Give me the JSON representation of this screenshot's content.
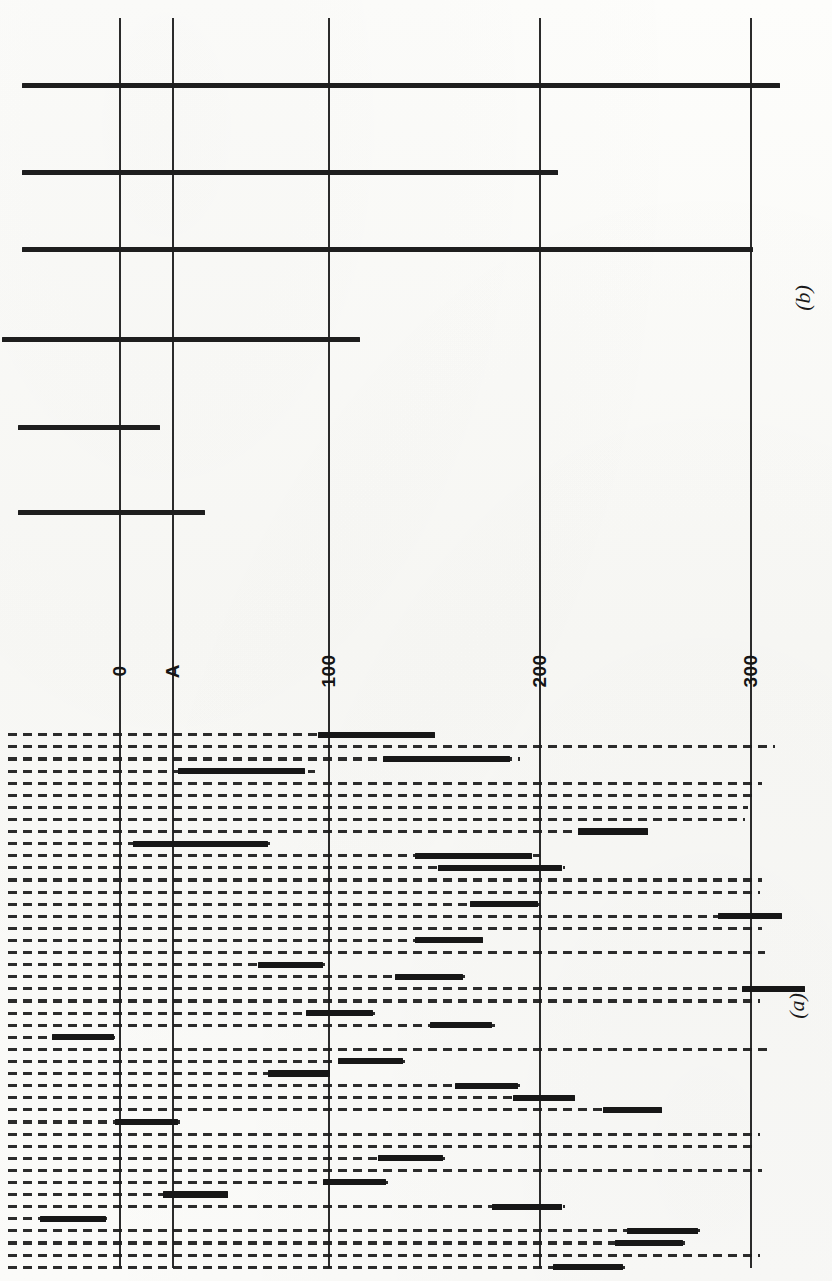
{
  "figure": {
    "panels": [
      {
        "id": "panel-b",
        "label": "(b)",
        "label_x": 790,
        "label_y": 285
      },
      {
        "id": "panel-a",
        "label": "(a)",
        "label_x": 784,
        "label_y": 993
      }
    ],
    "axis": {
      "orientation": "vertical-gridlines-rotated-figure",
      "unit_label": "",
      "ticks": [
        {
          "label": "0",
          "x": 120,
          "value": 0
        },
        {
          "label": "A",
          "x": 173,
          "value": 25
        },
        {
          "label": "100",
          "x": 329,
          "value": 100
        },
        {
          "label": "200",
          "x": 540,
          "value": 200
        },
        {
          "label": "300",
          "x": 751,
          "value": 300
        }
      ],
      "tick_label_y": 660,
      "gridline_top": 18,
      "gridline_bottom": 1268
    }
  },
  "chart_data": {
    "type": "bar",
    "title": "",
    "subtitle": "",
    "xlabel": "",
    "ylabel": "",
    "xlim": [
      -60,
      330
    ],
    "grid": true,
    "legend": "none",
    "annotations": [
      "(a)",
      "(b)"
    ],
    "axis_tick_labels": [
      "0",
      "A",
      "100",
      "200",
      "300"
    ],
    "panel_b": {
      "description": "Six solid horizontal bars, each starting at the left margin and extending to a measured end value.",
      "type": "bar",
      "categories": [
        "b1",
        "b2",
        "b3",
        "b4",
        "b5",
        "b6"
      ],
      "bars": [
        {
          "y": 83,
          "start_px": 22,
          "end_px": 780,
          "start_value": -47,
          "end_value": 314
        },
        {
          "y": 170,
          "start_px": 22,
          "end_px": 558,
          "start_value": -47,
          "end_value": 208
        },
        {
          "y": 247,
          "start_px": 22,
          "end_px": 753,
          "start_value": -47,
          "end_value": 301
        },
        {
          "y": 337,
          "start_px": 2,
          "end_px": 360,
          "start_value": -56,
          "end_value": 114
        },
        {
          "y": 425,
          "start_px": 18,
          "end_px": 160,
          "start_value": -48,
          "end_value": 19
        },
        {
          "y": 510,
          "start_px": 18,
          "end_px": 205,
          "start_value": -48,
          "end_value": 40
        }
      ]
    },
    "panel_a": {
      "description": "Forty-five rows; each row is a dashed range line spanning the full extent of the entry, overlaid by one thick solid segment marking the mapped interval.",
      "type": "bar",
      "row_height": 12.1,
      "row_top": 732,
      "rows": [
        {
          "i": 0,
          "dash_start": 8,
          "dash_end": 330,
          "bar_start": 318,
          "bar_end": 435
        },
        {
          "i": 1,
          "dash_start": 8,
          "dash_end": 775,
          "bar_start": null,
          "bar_end": null
        },
        {
          "i": 2,
          "dash_start": 8,
          "dash_end": 520,
          "bar_start": 383,
          "bar_end": 510
        },
        {
          "i": 3,
          "dash_start": 8,
          "dash_end": 315,
          "bar_start": 178,
          "bar_end": 305
        },
        {
          "i": 4,
          "dash_start": 8,
          "dash_end": 762,
          "bar_start": null,
          "bar_end": null
        },
        {
          "i": 5,
          "dash_start": 8,
          "dash_end": 758,
          "bar_start": null,
          "bar_end": null
        },
        {
          "i": 6,
          "dash_start": 8,
          "dash_end": 748,
          "bar_start": null,
          "bar_end": null
        },
        {
          "i": 7,
          "dash_start": 8,
          "dash_end": 745,
          "bar_start": null,
          "bar_end": null
        },
        {
          "i": 8,
          "dash_start": 8,
          "dash_end": 650,
          "bar_start": 578,
          "bar_end": 648
        },
        {
          "i": 9,
          "dash_start": 8,
          "dash_end": 270,
          "bar_start": 133,
          "bar_end": 268
        },
        {
          "i": 10,
          "dash_start": 8,
          "dash_end": 540,
          "bar_start": 415,
          "bar_end": 532
        },
        {
          "i": 11,
          "dash_start": 8,
          "dash_end": 565,
          "bar_start": 438,
          "bar_end": 562
        },
        {
          "i": 12,
          "dash_start": 8,
          "dash_end": 762,
          "bar_start": null,
          "bar_end": null
        },
        {
          "i": 13,
          "dash_start": 8,
          "dash_end": 760,
          "bar_start": null,
          "bar_end": null
        },
        {
          "i": 14,
          "dash_start": 8,
          "dash_end": 540,
          "bar_start": 470,
          "bar_end": 538
        },
        {
          "i": 15,
          "dash_start": 8,
          "dash_end": 780,
          "bar_start": 718,
          "bar_end": 782
        },
        {
          "i": 16,
          "dash_start": 8,
          "dash_end": 762,
          "bar_start": null,
          "bar_end": null
        },
        {
          "i": 17,
          "dash_start": 8,
          "dash_end": 485,
          "bar_start": 415,
          "bar_end": 483
        },
        {
          "i": 18,
          "dash_start": 8,
          "dash_end": 765,
          "bar_start": null,
          "bar_end": null
        },
        {
          "i": 19,
          "dash_start": 8,
          "dash_end": 325,
          "bar_start": 258,
          "bar_end": 323
        },
        {
          "i": 20,
          "dash_start": 8,
          "dash_end": 465,
          "bar_start": 395,
          "bar_end": 463
        },
        {
          "i": 21,
          "dash_start": 8,
          "dash_end": 805,
          "bar_start": 742,
          "bar_end": 805
        },
        {
          "i": 22,
          "dash_start": 8,
          "dash_end": 760,
          "bar_start": null,
          "bar_end": null
        },
        {
          "i": 23,
          "dash_start": 8,
          "dash_end": 375,
          "bar_start": 306,
          "bar_end": 373
        },
        {
          "i": 24,
          "dash_start": 8,
          "dash_end": 495,
          "bar_start": 430,
          "bar_end": 492
        },
        {
          "i": 25,
          "dash_start": 8,
          "dash_end": 115,
          "bar_start": 52,
          "bar_end": 114
        },
        {
          "i": 26,
          "dash_start": 8,
          "dash_end": 770,
          "bar_start": null,
          "bar_end": null
        },
        {
          "i": 27,
          "dash_start": 8,
          "dash_end": 405,
          "bar_start": 338,
          "bar_end": 403
        },
        {
          "i": 28,
          "dash_start": 8,
          "dash_end": 330,
          "bar_start": 268,
          "bar_end": 330
        },
        {
          "i": 29,
          "dash_start": 8,
          "dash_end": 520,
          "bar_start": 455,
          "bar_end": 518
        },
        {
          "i": 30,
          "dash_start": 8,
          "dash_end": 578,
          "bar_start": 513,
          "bar_end": 575
        },
        {
          "i": 31,
          "dash_start": 8,
          "dash_end": 665,
          "bar_start": 603,
          "bar_end": 662
        },
        {
          "i": 32,
          "dash_start": 8,
          "dash_end": 180,
          "bar_start": 115,
          "bar_end": 178
        },
        {
          "i": 33,
          "dash_start": 8,
          "dash_end": 760,
          "bar_start": null,
          "bar_end": null
        },
        {
          "i": 34,
          "dash_start": 8,
          "dash_end": 758,
          "bar_start": null,
          "bar_end": null
        },
        {
          "i": 35,
          "dash_start": 8,
          "dash_end": 445,
          "bar_start": 378,
          "bar_end": 443
        },
        {
          "i": 36,
          "dash_start": 8,
          "dash_end": 762,
          "bar_start": null,
          "bar_end": null
        },
        {
          "i": 37,
          "dash_start": 8,
          "dash_end": 388,
          "bar_start": 323,
          "bar_end": 386
        },
        {
          "i": 38,
          "dash_start": 8,
          "dash_end": 230,
          "bar_start": 163,
          "bar_end": 228
        },
        {
          "i": 39,
          "dash_start": 8,
          "dash_end": 565,
          "bar_start": 492,
          "bar_end": 562
        },
        {
          "i": 40,
          "dash_start": 8,
          "dash_end": 108,
          "bar_start": 40,
          "bar_end": 106
        },
        {
          "i": 41,
          "dash_start": 8,
          "dash_end": 700,
          "bar_start": 627,
          "bar_end": 698
        },
        {
          "i": 42,
          "dash_start": 8,
          "dash_end": 685,
          "bar_start": 615,
          "bar_end": 683
        },
        {
          "i": 43,
          "dash_start": 8,
          "dash_end": 760,
          "bar_start": null,
          "bar_end": null
        },
        {
          "i": 44,
          "dash_start": 8,
          "dash_end": 625,
          "bar_start": 553,
          "bar_end": 623
        }
      ]
    }
  }
}
